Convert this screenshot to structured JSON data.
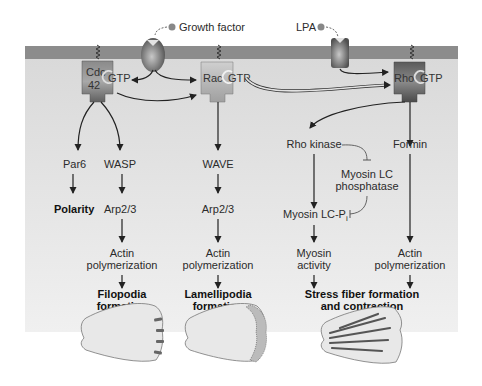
{
  "ligands": {
    "growth_factor": "Growth factor",
    "lpa": "LPA"
  },
  "gtpases": {
    "cdc42_line1": "Cdc",
    "cdc42_line2": "42",
    "rac": "Rac",
    "rho": "Rho",
    "gtp": "GTP"
  },
  "pathways": {
    "cdc42_par6": {
      "effector": "Par6",
      "outcome": "Polarity"
    },
    "cdc42_wasp": {
      "effector": "WASP",
      "step2": "Arp2/3",
      "step3_line1": "Actin",
      "step3_line2": "polymerization",
      "outcome_line1": "Filopodia",
      "outcome_line2": "formation"
    },
    "rac": {
      "effector": "WAVE",
      "step2": "Arp2/3",
      "step3_line1": "Actin",
      "step3_line2": "polymerization",
      "outcome_line1": "Lamellipodia",
      "outcome_line2": "formation"
    },
    "rho_kinase": {
      "effector": "Rho kinase",
      "inhibited": "Myosin LC",
      "inhibited_line2": "phosphatase",
      "step2": "Myosin LC-P",
      "step2_sub": "i",
      "step3_line1": "Myosin",
      "step3_line2": "activity"
    },
    "rho_formin": {
      "effector": "Formin",
      "step3_line1": "Actin",
      "step3_line2": "polymerization"
    },
    "rho_outcome_line1": "Stress fiber formation",
    "rho_outcome_line2": "and contraction"
  },
  "colors": {
    "membrane": "#8c8c8c",
    "cytoplasm": "#e2e2e2",
    "protein_dark": "#5a5a5a",
    "protein_light": "#c8c8c8",
    "cell_fill": "#e6e6e6"
  }
}
